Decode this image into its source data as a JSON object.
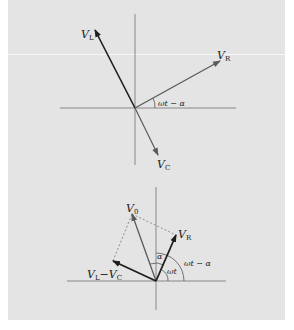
{
  "figure": {
    "background_color": "#e4e4e4",
    "top_diagram": {
      "title": "Phasor diagram of V_L, V_R, V_C",
      "labels": {
        "VL_main": "V",
        "VL_sub": "L",
        "VR_main": "V",
        "VR_sub": "R",
        "VC_main": "V",
        "VC_sub": "C",
        "angle": "ωt − α"
      }
    },
    "bottom_diagram": {
      "title": "Phasor sum V0",
      "labels": {
        "V0_main": "V",
        "V0_sub": "0",
        "VR_main": "V",
        "VR_sub": "R",
        "diff_main1": "V",
        "diff_sub1": "L",
        "diff_minus": "−",
        "diff_main2": "V",
        "diff_sub2": "C",
        "alpha": "α",
        "omega_t": "ωt",
        "angle": "ωt − α"
      }
    },
    "colors": {
      "axis": "#888888",
      "vector_dark": "#1e1e1e",
      "vector_gray": "#5a5a5a",
      "dashed": "#777777"
    }
  }
}
